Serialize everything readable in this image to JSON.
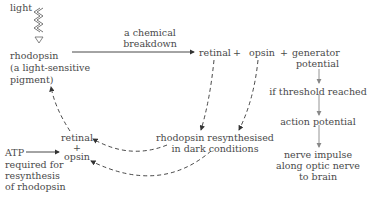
{
  "labels": {
    "light": "light",
    "rhodopsin_l1": "rhodopsin",
    "rhodopsin_l2": "(a light-sensitive",
    "rhodopsin_l3": "pigment)",
    "chem_l1": "a chemical",
    "chem_l2": "breakdown",
    "retinal": "retinal",
    "plus1": "+",
    "opsin": "opsin",
    "plus2": "+",
    "gen_l1": "generator",
    "gen_l2": "potential",
    "threshold": "if threshold reached",
    "action": "action potential",
    "nerve_l1": "nerve impulse",
    "nerve_l2": "along optic nerve",
    "nerve_l3": "to brain",
    "resynth_l1": "rhodopsin resynthesised",
    "resynth_l2": "in dark conditions",
    "ro_retinal": "retinal",
    "ro_plus": "+",
    "ro_opsin": "opsin",
    "atp_l1": "ATP",
    "atp_l2": "required for",
    "atp_l3": "resynthesis",
    "atp_l4": "of rhodopsin"
  },
  "colors": {
    "text": "#4a4a4a",
    "line": "#444444",
    "flow": "#888888"
  }
}
